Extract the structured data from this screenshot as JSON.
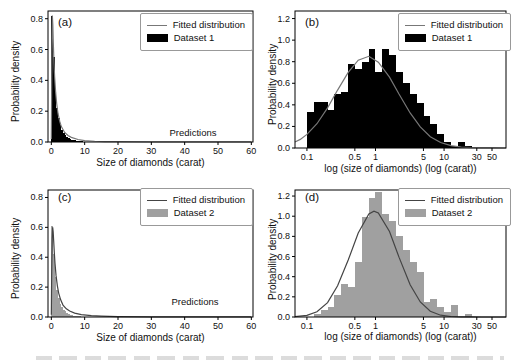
{
  "figure": {
    "background": "#ffffff",
    "layout": "2x2 histogram panels with fitted distribution curves"
  },
  "colors": {
    "dataset1_fill": "#000000",
    "dataset2_fill": "#a0a0a0",
    "fit_line_gray": "#777777",
    "fit_line_dark": "#444444",
    "axes": "#000000"
  },
  "chart_data": [
    {
      "panel_label": "(a)",
      "type": "bar",
      "subtype": "histogram_with_fit",
      "xlabel": "Size of diamonds (carat)",
      "ylabel": "Probability density",
      "annotation": "Predictions",
      "xscale": "linear",
      "xlim": [
        -1,
        60.5
      ],
      "ylim": [
        0,
        0.85
      ],
      "xticks": [
        0,
        10,
        20,
        30,
        40,
        50,
        60
      ],
      "xtick_labels": [
        "0",
        "10",
        "20",
        "30",
        "40",
        "50",
        "60"
      ],
      "yticks": [
        0,
        0.2,
        0.4,
        0.6,
        0.8
      ],
      "ytick_labels": [
        "0.0",
        "0.2",
        "0.4",
        "0.6",
        "0.8"
      ],
      "legend": {
        "position": "upper right",
        "entries": [
          {
            "label": "Fitted distribution",
            "type": "line",
            "color": "#777777"
          },
          {
            "label": "Dataset 1",
            "type": "patch",
            "color": "#000000"
          }
        ]
      },
      "hist": {
        "color": "#000000",
        "bin_edges": [
          0,
          0.5,
          1,
          1.5,
          2,
          2.5,
          3,
          3.5,
          4,
          4.5,
          5,
          5.5,
          6,
          6.5,
          7,
          7.5,
          8,
          8.5,
          9,
          9.5,
          10,
          10.5,
          11,
          11.5,
          12
        ],
        "heights": [
          0.82,
          0.55,
          0.33,
          0.22,
          0.155,
          0.11,
          0.08,
          0.06,
          0.045,
          0.034,
          0.026,
          0.02,
          0.016,
          0.012,
          0.01,
          0.008,
          0.006,
          0.005,
          0.004,
          0.003,
          0.003,
          0.002,
          0.002,
          0.001
        ]
      },
      "fit_curve": {
        "color": "#777777",
        "x": [
          0,
          0.1,
          0.2,
          0.3,
          0.45,
          0.6,
          0.8,
          1,
          1.3,
          1.6,
          2,
          2.5,
          3,
          4,
          5,
          6,
          8,
          10,
          13,
          16,
          20,
          30,
          45,
          60
        ],
        "y": [
          0.02,
          0.35,
          0.68,
          0.82,
          0.76,
          0.64,
          0.51,
          0.42,
          0.32,
          0.25,
          0.185,
          0.135,
          0.1,
          0.062,
          0.042,
          0.03,
          0.016,
          0.009,
          0.005,
          0.003,
          0.002,
          0.001,
          0.0005,
          0.0003
        ]
      }
    },
    {
      "panel_label": "(b)",
      "type": "bar",
      "subtype": "histogram_with_fit",
      "xlabel": "log (size of diamonds) (log (carat))",
      "ylabel": "Probability density",
      "xscale": "log",
      "xlim": [
        0.067,
        80
      ],
      "ylim": [
        0,
        1.27
      ],
      "xticks": [
        0.1,
        0.5,
        1,
        5,
        10,
        30,
        50
      ],
      "xtick_labels": [
        "0.1",
        "0.5",
        "1",
        "5",
        "10",
        "30",
        "50"
      ],
      "yticks": [
        0,
        0.2,
        0.4,
        0.6,
        0.8,
        1.0,
        1.2
      ],
      "ytick_labels": [
        "0.0",
        "0.2",
        "0.4",
        "0.6",
        "0.8",
        "1.0",
        "1.2"
      ],
      "legend": {
        "position": "upper right",
        "entries": [
          {
            "label": "Fitted distribution",
            "type": "line",
            "color": "#777777"
          },
          {
            "label": "Dataset 1",
            "type": "patch",
            "color": "#000000"
          }
        ]
      },
      "hist": {
        "color": "#000000",
        "bin_edges": [
          0.1,
          0.126,
          0.158,
          0.2,
          0.251,
          0.316,
          0.398,
          0.501,
          0.631,
          0.794,
          1.0,
          1.259,
          1.585,
          1.995,
          2.512,
          3.162,
          3.981,
          5.012,
          6.31,
          7.943,
          10.0,
          12.59,
          15.85,
          19.95,
          25.12
        ],
        "heights": [
          0.33,
          0.43,
          0.43,
          0.35,
          0.5,
          0.52,
          0.78,
          0.73,
          0.8,
          0.92,
          0.7,
          0.92,
          0.86,
          0.7,
          0.6,
          0.5,
          0.42,
          0.3,
          0.22,
          0.13,
          0.06,
          0.02,
          0.06,
          0.02
        ]
      },
      "fit_curve": {
        "color": "#777777",
        "x": [
          0.067,
          0.08,
          0.1,
          0.14,
          0.2,
          0.28,
          0.4,
          0.56,
          0.8,
          1.1,
          1.6,
          2.2,
          3.2,
          4.5,
          6.3,
          8.9,
          12.6,
          17.8,
          25,
          35,
          50,
          80
        ],
        "y": [
          0.055,
          0.08,
          0.126,
          0.225,
          0.372,
          0.537,
          0.701,
          0.814,
          0.85,
          0.796,
          0.657,
          0.5,
          0.325,
          0.195,
          0.105,
          0.051,
          0.022,
          0.008,
          0.003,
          0.001,
          0.0003,
          0.0001
        ]
      }
    },
    {
      "panel_label": "(c)",
      "type": "bar",
      "subtype": "histogram_with_fit",
      "xlabel": "Size of diamonds (carat)",
      "ylabel": "Probability density",
      "annotation": "Predictions",
      "xscale": "linear",
      "xlim": [
        -1,
        60.5
      ],
      "ylim": [
        0,
        0.85
      ],
      "xticks": [
        0,
        10,
        20,
        30,
        40,
        50,
        60
      ],
      "xtick_labels": [
        "0",
        "10",
        "20",
        "30",
        "40",
        "50",
        "60"
      ],
      "yticks": [
        0,
        0.2,
        0.4,
        0.6,
        0.8
      ],
      "ytick_labels": [
        "0.0",
        "0.2",
        "0.4",
        "0.6",
        "0.8"
      ],
      "legend": {
        "position": "upper right",
        "entries": [
          {
            "label": "Fitted distribution",
            "type": "line",
            "color": "#444444"
          },
          {
            "label": "Dataset 2",
            "type": "patch",
            "color": "#a0a0a0"
          }
        ]
      },
      "hist": {
        "color": "#a0a0a0",
        "bin_edges": [
          0,
          0.5,
          1,
          1.5,
          2,
          2.5,
          3,
          3.5,
          4,
          4.5,
          5,
          5.5,
          6,
          6.5,
          7,
          7.5,
          8,
          8.5,
          9,
          9.5,
          10,
          10.5,
          11,
          11.5,
          12
        ],
        "heights": [
          0.61,
          0.42,
          0.27,
          0.18,
          0.13,
          0.09,
          0.065,
          0.05,
          0.038,
          0.028,
          0.021,
          0.016,
          0.012,
          0.009,
          0.007,
          0.006,
          0.005,
          0.004,
          0.003,
          0.002,
          0.002,
          0.001,
          0.001,
          0.001
        ]
      },
      "fit_curve": {
        "color": "#444444",
        "x": [
          0,
          0.1,
          0.25,
          0.4,
          0.55,
          0.7,
          0.9,
          1.1,
          1.4,
          1.8,
          2.2,
          2.8,
          3.5,
          4.5,
          5.5,
          7,
          9,
          12,
          15,
          20,
          30,
          45,
          60
        ],
        "y": [
          0.015,
          0.28,
          0.52,
          0.6,
          0.57,
          0.51,
          0.43,
          0.36,
          0.28,
          0.21,
          0.16,
          0.115,
          0.08,
          0.055,
          0.04,
          0.026,
          0.016,
          0.009,
          0.006,
          0.003,
          0.0015,
          0.0007,
          0.0004
        ]
      }
    },
    {
      "panel_label": "(d)",
      "type": "bar",
      "subtype": "histogram_with_fit",
      "xlabel": "log (size of diamonds) (log (carat))",
      "ylabel": "Probability density",
      "xscale": "log",
      "xlim": [
        0.067,
        80
      ],
      "ylim": [
        0,
        1.26
      ],
      "xticks": [
        0.1,
        0.5,
        1,
        5,
        10,
        30,
        50
      ],
      "xtick_labels": [
        "0.1",
        "0.5",
        "1",
        "5",
        "10",
        "30",
        "50"
      ],
      "yticks": [
        0,
        0.2,
        0.4,
        0.6,
        0.8,
        1.0,
        1.2
      ],
      "ytick_labels": [
        "0.0",
        "0.2",
        "0.4",
        "0.6",
        "0.8",
        "1.0",
        "1.2"
      ],
      "legend": {
        "position": "upper right",
        "entries": [
          {
            "label": "Fitted distribution",
            "type": "line",
            "color": "#444444"
          },
          {
            "label": "Dataset 2",
            "type": "patch",
            "color": "#a0a0a0"
          }
        ]
      },
      "hist": {
        "color": "#a0a0a0",
        "bin_edges": [
          0.126,
          0.158,
          0.2,
          0.251,
          0.316,
          0.398,
          0.501,
          0.631,
          0.794,
          1.0,
          1.259,
          1.585,
          1.995,
          2.512,
          3.162,
          3.981,
          5.012,
          6.31,
          7.943,
          10.0,
          12.59,
          15.85,
          19.95,
          25.12
        ],
        "heights": [
          0.03,
          0.07,
          0.1,
          0.22,
          0.33,
          0.3,
          0.55,
          0.99,
          1.18,
          1.24,
          1.02,
          0.95,
          0.8,
          0.66,
          0.55,
          0.45,
          0.15,
          0.18,
          0.1,
          0.05,
          0.12,
          0.0,
          0.03
        ]
      },
      "fit_curve": {
        "color": "#444444",
        "x": [
          0.067,
          0.1,
          0.14,
          0.2,
          0.28,
          0.4,
          0.56,
          0.8,
          0.95,
          1.1,
          1.6,
          2.2,
          3.2,
          4.5,
          6.3,
          8.9,
          12.6,
          17.8,
          25,
          35,
          50,
          80
        ],
        "y": [
          0.003,
          0.016,
          0.052,
          0.143,
          0.309,
          0.565,
          0.833,
          1.023,
          1.05,
          1.033,
          0.848,
          0.594,
          0.32,
          0.149,
          0.057,
          0.018,
          0.005,
          0.001,
          0.0003,
          0.0001,
          0,
          0
        ]
      }
    }
  ]
}
